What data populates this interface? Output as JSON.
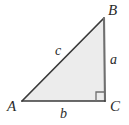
{
  "figure": {
    "kind": "right-triangle-diagram",
    "background_color": "#ffffff",
    "fill_color": "#ececec",
    "stroke_color": "#3a3a3a",
    "label_color": "#2b2b2b",
    "vertices": {
      "a": {
        "label": "A",
        "x": 22,
        "y": 101
      },
      "b": {
        "label": "B",
        "x": 104,
        "y": 18
      },
      "c": {
        "label": "C",
        "x": 105,
        "y": 101
      }
    },
    "sides": {
      "hypotenuse": {
        "label": "c",
        "from": "A",
        "to": "B"
      },
      "vertical": {
        "label": "a",
        "from": "B",
        "to": "C"
      },
      "base": {
        "label": "b",
        "from": "A",
        "to": "C"
      }
    },
    "right_angle": {
      "at_vertex": "C",
      "marker": "square",
      "size": 9
    }
  }
}
